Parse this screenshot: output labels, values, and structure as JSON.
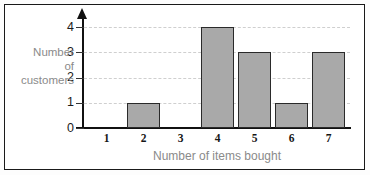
{
  "figure": {
    "background_color": "#ffffff",
    "frame_color": "#1a1a1a"
  },
  "chart_data": {
    "type": "bar",
    "title": "",
    "categories": [
      "1",
      "2",
      "3",
      "4",
      "5",
      "6",
      "7"
    ],
    "values": [
      0,
      1,
      0,
      4,
      3,
      1,
      3
    ],
    "xlabel": "Number of items bought",
    "ylabel": "Number of customers",
    "ylabel_lines": [
      "Number",
      "of",
      "customers"
    ],
    "ytick_labels": [
      "0",
      "1",
      "2",
      "3",
      "4"
    ],
    "ytick_values": [
      0,
      1,
      2,
      3,
      4
    ],
    "xtick_labels": [
      "1",
      "2",
      "3",
      "4",
      "5",
      "6",
      "7"
    ],
    "ylim": [
      0,
      4
    ],
    "grid": true,
    "grid_style": "dashed",
    "grid_color": "#cfcfcf",
    "legend": null,
    "bar_fill_color": "#a9a9a9",
    "bar_edge_color": "#2a2a2a",
    "axis_color": "#111111",
    "label_color": "#8a8a8a",
    "tick_color": "#161616",
    "y_axis_arrow": true
  }
}
